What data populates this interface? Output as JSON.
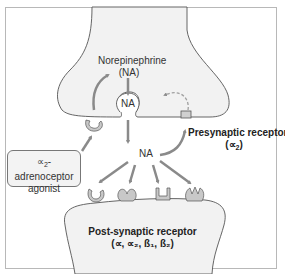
{
  "diagram": {
    "type": "synapse-schematic",
    "labels": {
      "neurotransmitter_name": "Norepinephrine",
      "neurotransmitter_abbr": "(NA)",
      "vesicle_label": "NA",
      "cleft_label": "NA",
      "presynaptic_receptor_title": "Presynaptic receptor",
      "presynaptic_receptor_type_open": "(",
      "presynaptic_receptor_type_symbol": "∝",
      "presynaptic_receptor_type_sub": "2",
      "presynaptic_receptor_type_close": ")",
      "agonist_symbol": "∝",
      "agonist_sub": "2",
      "agonist_line1_rest": "-adrenoceptor",
      "agonist_line2": "agonist",
      "postsynaptic_title": "Post-synaptic receptor",
      "postsynaptic_types": "(∝, ∝₂, ß₁, ß₂)"
    },
    "colors": {
      "neuron_fill": "#f2f2f2",
      "outline": "#555555",
      "arrow": "#8a8a8a",
      "receptor_fill": "#c8c8c8",
      "frame_border": "#b8b8b8"
    },
    "receptor_shapes": [
      "c-cup",
      "heart",
      "u-cup",
      "crown"
    ]
  }
}
